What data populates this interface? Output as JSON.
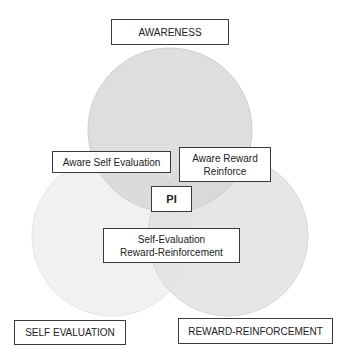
{
  "diagram": {
    "type": "venn",
    "circles": [
      {
        "id": "awareness",
        "label": "AWARENESS",
        "fill": "#dcdcdc"
      },
      {
        "id": "self_evaluation",
        "label": "SELF EVALUATION",
        "fill": "#f0f0f0"
      },
      {
        "id": "reward_reinforcement",
        "label": "REWARD-REINFORCEMENT",
        "fill": "#e0e0e0"
      }
    ],
    "intersections": {
      "awareness_self": "Aware Self Evaluation",
      "awareness_reward_line1": "Aware Reward",
      "awareness_reward_line2": "Reinforce",
      "center": "PI",
      "self_reward_line1": "Self-Evaluation",
      "self_reward_line2": "Reward-Reinforcement"
    }
  }
}
